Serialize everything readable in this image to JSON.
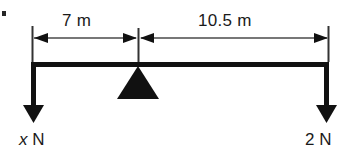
{
  "diagram": {
    "type": "lever-free-body-diagram",
    "background_color": "#ffffff",
    "stroke_color": "#111111",
    "dimensions": {
      "left_segment": {
        "label": "7 m",
        "value": 7,
        "unit": "m",
        "from": "left-end",
        "to": "fulcrum"
      },
      "right_segment": {
        "label": "10.5 m",
        "value": 10.5,
        "unit": "m",
        "from": "fulcrum",
        "to": "right-end"
      }
    },
    "forces": {
      "left": {
        "magnitude_symbol": "x",
        "unit_label": " N",
        "direction": "down",
        "at": "left-end"
      },
      "right": {
        "magnitude_symbol": "2",
        "unit_label": " N",
        "direction": "down",
        "at": "right-end"
      }
    },
    "fulcrum": {
      "shape": "triangle",
      "fill": "#111111",
      "position": "7 m from left end"
    }
  },
  "geometry": {
    "beam_left_x": 32,
    "beam_right_x": 328,
    "beam_y": 64,
    "fulcrum_x": 138,
    "dim_line_y": 38,
    "arrow_tip_y": 122
  }
}
